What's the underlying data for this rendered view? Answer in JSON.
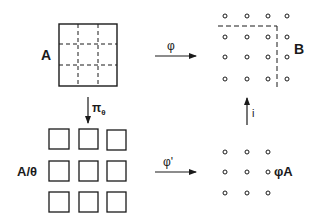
{
  "diagram": {
    "nodes": {
      "A": {
        "label": "A",
        "kind": "square-grid-dashed",
        "rows": 3,
        "cols": 3
      },
      "B": {
        "label": "B",
        "kind": "dot-grid",
        "rows": 4,
        "cols": 4,
        "dashed_partition": "L-shape excluding top row and right column"
      },
      "A_quotient": {
        "label": "A/θ",
        "kind": "separated-squares",
        "rows": 3,
        "cols": 3
      },
      "phiA": {
        "label": "φA",
        "kind": "dot-grid",
        "rows": 3,
        "cols": 3
      }
    },
    "arrows": {
      "phi": {
        "label": "φ",
        "from": "A",
        "to": "B",
        "direction": "right"
      },
      "pi_theta": {
        "label": "π",
        "subscript": "θ",
        "from": "A",
        "to": "A/θ",
        "direction": "down"
      },
      "phi_prime": {
        "label": "φ'",
        "from": "A/θ",
        "to": "φA",
        "direction": "right"
      },
      "inclusion": {
        "label": "i",
        "from": "φA",
        "to": "B",
        "direction": "up"
      }
    },
    "colors": {
      "ink": "#1a1a1a",
      "background": "#ffffff"
    }
  }
}
